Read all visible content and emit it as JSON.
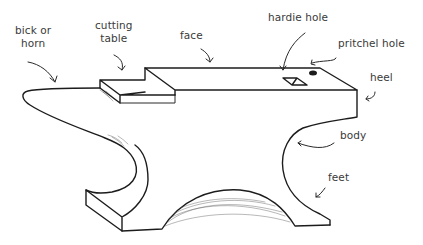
{
  "diagram": {
    "labels": {
      "horn": "bick or\nhorn",
      "cutting_table": "cutting\ntable",
      "face": "face",
      "hardie_hole": "hardie hole",
      "pritchel_hole": "pritchel hole",
      "heel": "heel",
      "body": "body",
      "feet": "feet"
    },
    "colors": {
      "ink": "#1c1c1c",
      "label_text": "#3a3a3a",
      "background": "#ffffff"
    }
  }
}
